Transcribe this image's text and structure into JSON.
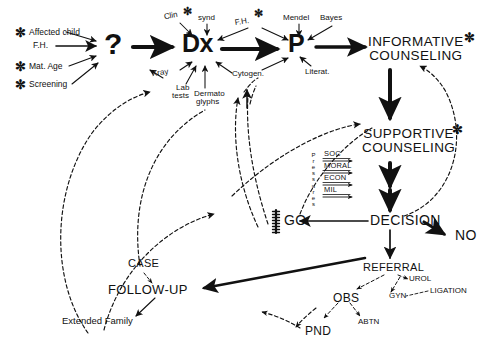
{
  "diagram": {
    "background_color": "#ffffff",
    "ink_color": "#111111",
    "asterisk_glyph": "✼",
    "inputs": [
      {
        "id": "affected-child",
        "label": "Affected child",
        "starred": true
      },
      {
        "id": "family-history",
        "label": "F.H.",
        "starred": false
      },
      {
        "id": "maternal-age",
        "label": "Mat. Age",
        "starred": true
      },
      {
        "id": "screening",
        "label": "Screening",
        "starred": true
      }
    ],
    "nodes": {
      "question": "?",
      "dx": "Dx",
      "p": "P",
      "informative_counseling_line1": "INFORMATIVE",
      "informative_counseling_line2": "COUNSELING",
      "supportive_counseling_line1": "SUPPORTIVE",
      "supportive_counseling_line2": "COUNSELING",
      "decision": "DECISION",
      "go": "GO",
      "no": "NO",
      "referral": "REFERRAL",
      "case": "CASE",
      "follow_up": "FOLLOW-UP",
      "extended_family": "Extended Family",
      "obs": "OBS",
      "urol": "UROL",
      "gyn": "GYN",
      "ligation": "LIGATION",
      "abtn": "ABTN",
      "pnd": "PND"
    },
    "dx_inputs_top": [
      {
        "id": "clin",
        "label": "Clin",
        "starred": true
      },
      {
        "id": "synd",
        "label": "synd",
        "starred": false
      }
    ],
    "dx_inputs_bottom": [
      {
        "id": "xray",
        "label": "Xray"
      },
      {
        "id": "lab-tests-l1",
        "label": "Lab"
      },
      {
        "id": "lab-tests-l2",
        "label": "tests"
      },
      {
        "id": "dermatoglyphs-l1",
        "label": "Dermato"
      },
      {
        "id": "dermatoglyphs-l2",
        "label": "glyphs"
      },
      {
        "id": "cytogen",
        "label": "Cytogen."
      }
    ],
    "p_inputs": [
      {
        "id": "fh-p",
        "label": "F.H.",
        "starred": true
      },
      {
        "id": "mendel",
        "label": "Mendel",
        "starred": false
      },
      {
        "id": "bayes",
        "label": "Bayes",
        "starred": false
      },
      {
        "id": "literat",
        "label": "Literat.",
        "starred": false
      }
    ],
    "pressures": {
      "axis_label": "Pressures",
      "axis_letters": [
        "P",
        "r",
        "e",
        "s",
        "s",
        "u",
        "r",
        "e",
        "s"
      ],
      "items": [
        "SOC",
        "MORAL",
        "ECON",
        "MIL"
      ]
    },
    "starred_nodes": [
      "INFORMATIVE COUNSELING",
      "SUPPORTIVE COUNSELING"
    ],
    "edge_styles": {
      "solid_heavy": "primary process flow",
      "solid_thin": "branch flow",
      "dashed": "feedback loop",
      "barred": "blocked / gate"
    }
  }
}
